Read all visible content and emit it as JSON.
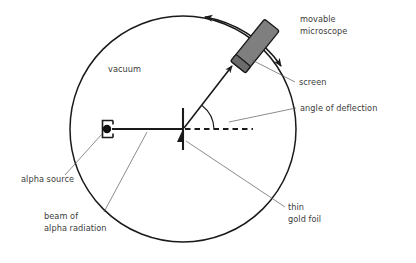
{
  "figure": {
    "background_color": "#ffffff",
    "line_color": "#1a1a1a",
    "leader_color": "#5a5a5a",
    "text_color": "#3c3c3c",
    "microscope_fill": "#7f7f7f",
    "microscope_edge": "#1a1a1a"
  },
  "labels": {
    "vacuum": "vacuum",
    "movable_microscope_line1": "movable",
    "movable_microscope_line2": "microscope",
    "screen": "screen",
    "angle_of_deflection": "angle of deflection",
    "alpha_source": "alpha source",
    "beam_line1": "beam of",
    "beam_line2": "alpha radiation",
    "thin_gold_foil_line1": "thin",
    "thin_gold_foil_line2": "gold foil"
  },
  "geometry": {
    "chamber_center_x": 183,
    "chamber_center_y": 129,
    "chamber_radius": 113,
    "foil_x": 183,
    "foil_y": 129,
    "source_x": 107,
    "source_y": 129,
    "beam_axis_y": 129,
    "deflected_ray_angle_deg": 52,
    "angle_arc_radius": 30
  }
}
